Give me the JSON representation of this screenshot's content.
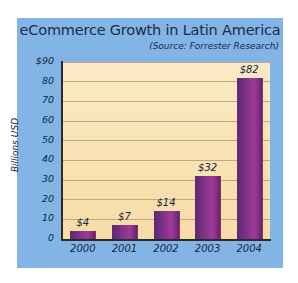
{
  "chart_data": {
    "type": "bar",
    "title": "eCommerce Growth in Latin America",
    "subtitle": "(Source: Forrester Research)",
    "categories": [
      "2000",
      "2001",
      "2002",
      "2003",
      "2004"
    ],
    "values": [
      4,
      7,
      14,
      32,
      82
    ],
    "value_labels": [
      "$4",
      "$7",
      "$14",
      "$32",
      "$82"
    ],
    "xlabel": "",
    "ylabel": "Billions USD",
    "ylim": [
      0,
      90
    ],
    "ytick_labels": [
      "$90",
      "80",
      "70",
      "60",
      "50",
      "40",
      "30",
      "20",
      "10",
      "0"
    ],
    "ytick_values": [
      90,
      80,
      70,
      60,
      50,
      40,
      30,
      20,
      10,
      0
    ],
    "grid": true,
    "legend": "none",
    "colors": {
      "panel_background": "#82b4e6",
      "plot_background": "#fae6bc",
      "bar_dark": "#5c2a72",
      "bar_light": "#a03a96",
      "gridline": "#b9a98a",
      "axis": "#2b2b2b",
      "text": "#14243f"
    }
  }
}
